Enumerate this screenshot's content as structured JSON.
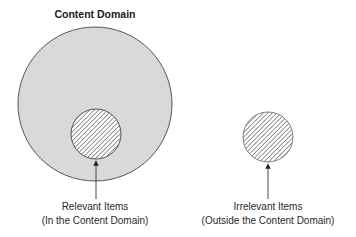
{
  "diagram": {
    "title": "Content Domain",
    "colors": {
      "domain_fill": "#d9d9d9",
      "outline": "#555555",
      "hatch": "#444444",
      "background": "#ffffff"
    },
    "domain_circle": {
      "cx": 95,
      "cy": 104,
      "r": 77
    },
    "relevant": {
      "circle": {
        "cx": 96,
        "cy": 134,
        "r": 25
      },
      "label_line1": "Relevant Items",
      "label_line2": "(In the Content Domain)"
    },
    "irrelevant": {
      "circle": {
        "cx": 268,
        "cy": 137,
        "r": 25
      },
      "label_line1": "Irrelevant Items",
      "label_line2": "(Outside the Content Domain)"
    }
  }
}
